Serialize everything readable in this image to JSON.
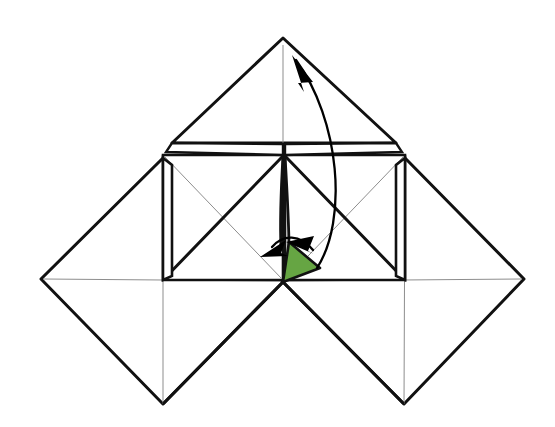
{
  "canvas": {
    "width": 555,
    "height": 427,
    "background": "#ffffff"
  },
  "figure": {
    "kind": "geometric-diagram"
  },
  "colors": {
    "stroke_heavy": "#111111",
    "stroke_light": "#8d8d8d",
    "highlight_fill": "#66a543",
    "highlight_stroke": "#111111",
    "arrow_fill": "#000000",
    "background": "#ffffff"
  },
  "strokes": {
    "heavy_width": 3.0,
    "medium_width": 2.2,
    "light_width": 1.0,
    "arc_width": 2.2
  },
  "geometry": {
    "top_apex": {
      "x": 283,
      "y": 38
    },
    "center": {
      "x": 283,
      "y": 282
    },
    "left_extreme": {
      "x": 41,
      "y": 279
    },
    "right_extreme": {
      "x": 524,
      "y": 279
    },
    "bottom_left_vertex": {
      "x": 163,
      "y": 404
    },
    "bottom_right_vertex": {
      "x": 404,
      "y": 404
    },
    "mid_band_top_y": 155,
    "mid_band_bottom_y": 280,
    "top_triangle_base_left": {
      "x": 172,
      "y": 143
    },
    "top_triangle_base_right": {
      "x": 396,
      "y": 143
    }
  },
  "shapes": {
    "top_triangle": {
      "name": "upper-triangle-flap",
      "points": "283,38 172,143 396,143"
    },
    "top_flap_left": {
      "name": "upper-left-flap-sliver",
      "points": "172,143 283,144 283,155 166,152"
    },
    "top_flap_right": {
      "name": "upper-right-flap-sliver",
      "points": "396,143 285,144 285,155 402,152"
    },
    "center_square_left": {
      "name": "center-square-left",
      "points": "163,155 283,155 283,280 163,280"
    },
    "center_square_right": {
      "name": "center-square-right",
      "points": "285,155 405,155 405,280 285,280"
    },
    "left_sliver": {
      "name": "left-edge-sliver",
      "points": "163,158 172,165 172,276 163,280"
    },
    "right_sliver": {
      "name": "right-edge-sliver",
      "points": "405,158 396,165 396,276 405,280"
    },
    "diamond_left": {
      "name": "lower-left-diamond",
      "points": "163,158 41,279 163,404 283,282"
    },
    "diamond_right": {
      "name": "lower-right-diamond",
      "points": "405,158 524,279 404,404 283,282"
    },
    "green_triangle": {
      "name": "highlighted-green-triangle",
      "points": "283,282 289,242 320,268"
    }
  },
  "creases": {
    "light": [
      {
        "name": "crease-top-center-vertical",
        "x1": 283,
        "y1": 40,
        "x2": 283,
        "y2": 152
      },
      {
        "name": "crease-left-square-diagonal-down",
        "x1": 163,
        "y1": 156,
        "x2": 283,
        "y2": 280
      },
      {
        "name": "crease-right-square-diagonal-down",
        "x1": 405,
        "y1": 156,
        "x2": 283,
        "y2": 280
      },
      {
        "name": "crease-left-diamond-horizontal",
        "x1": 41,
        "y1": 279,
        "x2": 283,
        "y2": 281
      },
      {
        "name": "crease-right-diamond-horizontal",
        "x1": 283,
        "y1": 281,
        "x2": 524,
        "y2": 279
      },
      {
        "name": "crease-left-diamond-vertical",
        "x1": 163,
        "y1": 158,
        "x2": 163,
        "y2": 404
      },
      {
        "name": "crease-right-diamond-vertical",
        "x1": 405,
        "y1": 158,
        "x2": 404,
        "y2": 404
      }
    ],
    "heavy": [
      {
        "name": "crease-left-square-diagonal-up",
        "x1": 163,
        "y1": 280,
        "x2": 283,
        "y2": 156
      },
      {
        "name": "crease-right-square-diagonal-up",
        "x1": 405,
        "y1": 280,
        "x2": 285,
        "y2": 156
      },
      {
        "name": "crease-center-spine-left",
        "x1": 283,
        "y1": 156,
        "x2": 281,
        "y2": 250
      },
      {
        "name": "crease-center-spine-right",
        "x1": 285,
        "y1": 156,
        "x2": 288,
        "y2": 250
      }
    ]
  },
  "arrows": {
    "fold_up_arc": {
      "name": "fold-up-arrow",
      "label": "fold upward to apex",
      "path": "M 317,268 C 348,220 340,120 296,60",
      "head": "296,60 316,78 303,84"
    },
    "fold_down_left": {
      "name": "fold-down-left-arrow",
      "label": "fold down-left",
      "path": "M 298,238 C 292,243 284,244 276,246",
      "head": "265,252 285,240 284,254"
    },
    "fold_down_right": {
      "name": "fold-down-right-arrow",
      "label": "fold down-right",
      "path": "M 318,250 C 314,243 308,238 301,236",
      "head": "291,239 312,234 308,248"
    }
  }
}
